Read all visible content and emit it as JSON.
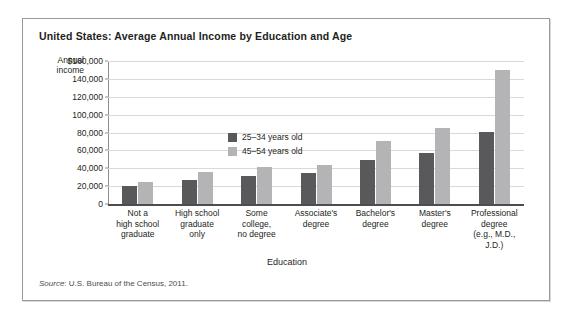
{
  "chart_data": {
    "type": "bar",
    "title": "United States: Average Annual Income by Education and Age",
    "xlabel": "Education",
    "ylabel": "Annual income",
    "ylim": [
      0,
      160000
    ],
    "ytick_labels": [
      "$160,000",
      "140,000",
      "120,000",
      "100,000",
      "80,000",
      "60,000",
      "40,000",
      "20,000",
      "0"
    ],
    "ytick_values": [
      160000,
      140000,
      120000,
      100000,
      80000,
      60000,
      40000,
      20000,
      0
    ],
    "grid": true,
    "legend_position": "upper-left-inside",
    "categories": [
      "Not a\nhigh school\ngraduate",
      "High school\ngraduate\nonly",
      "Some\ncollege,\nno degree",
      "Associate's\ndegree",
      "Bachelor's\ndegree",
      "Master's\ndegree",
      "Professional\ndegree\n(e.g., M.D., J.D.)"
    ],
    "series": [
      {
        "name": "25–34 years old",
        "color": "#59595b",
        "values": [
          20000,
          27000,
          31000,
          35000,
          49000,
          57000,
          81000
        ]
      },
      {
        "name": "45–54 years old",
        "color": "#b4b4b6",
        "values": [
          25000,
          36000,
          41000,
          44000,
          71000,
          85000,
          150000
        ]
      }
    ],
    "source": "U.S. Bureau of the Census, 2011.",
    "source_word": "Source"
  },
  "axis": {
    "y_caption_line1": "Annual",
    "y_caption_line2": "income"
  }
}
